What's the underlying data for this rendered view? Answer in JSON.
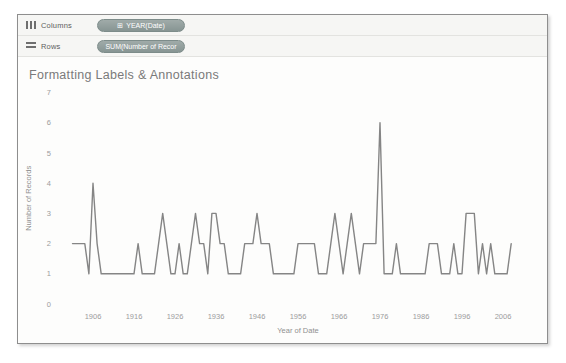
{
  "shelves": {
    "columns": {
      "label": "Columns",
      "pill": {
        "icon_glyph": "⊞",
        "text": "YEAR(Date)"
      }
    },
    "rows": {
      "label": "Rows",
      "pill": {
        "text": "SUM(Number of Recor"
      }
    }
  },
  "sheet": {
    "title": "Formatting Labels & Annotations"
  },
  "colors": {
    "line": "#858585",
    "pill_bg": "#8d9a98",
    "frame_border": "#8e8e8e",
    "axis_text": "#9c9c9c"
  },
  "chart_data": {
    "type": "line",
    "title": "Formatting Labels & Annotations",
    "xlabel": "Year of Date",
    "ylabel": "Number of Records",
    "x_ticks": [
      1906,
      1916,
      1926,
      1936,
      1946,
      1956,
      1966,
      1976,
      1986,
      1996,
      2006
    ],
    "y_ticks": [
      0,
      1,
      2,
      3,
      4,
      5,
      6,
      7
    ],
    "ylim": [
      0,
      7
    ],
    "xlim": [
      1901,
      2008
    ],
    "grid": false,
    "legend": "none",
    "line_color": "#858585",
    "series": [
      {
        "name": "SUM(Number of Records)",
        "x": [
          1901,
          1902,
          1903,
          1904,
          1905,
          1906,
          1907,
          1908,
          1909,
          1910,
          1911,
          1912,
          1913,
          1914,
          1915,
          1916,
          1917,
          1918,
          1919,
          1920,
          1921,
          1922,
          1923,
          1924,
          1925,
          1926,
          1927,
          1928,
          1929,
          1930,
          1931,
          1932,
          1933,
          1934,
          1935,
          1936,
          1937,
          1938,
          1939,
          1940,
          1941,
          1942,
          1943,
          1944,
          1945,
          1946,
          1947,
          1948,
          1949,
          1950,
          1951,
          1952,
          1953,
          1954,
          1955,
          1956,
          1957,
          1958,
          1959,
          1960,
          1961,
          1962,
          1963,
          1964,
          1965,
          1966,
          1967,
          1968,
          1969,
          1970,
          1971,
          1972,
          1973,
          1974,
          1975,
          1976,
          1977,
          1978,
          1979,
          1980,
          1981,
          1982,
          1983,
          1984,
          1985,
          1986,
          1987,
          1988,
          1989,
          1990,
          1991,
          1992,
          1993,
          1994,
          1995,
          1996,
          1997,
          1998,
          1999,
          2000,
          2001,
          2002,
          2003,
          2004,
          2005,
          2006,
          2007,
          2008
        ],
        "values": [
          2,
          2,
          2,
          2,
          1,
          4,
          2,
          1,
          1,
          1,
          1,
          1,
          1,
          1,
          1,
          1,
          2,
          1,
          1,
          1,
          1,
          2,
          3,
          2,
          1,
          1,
          2,
          1,
          1,
          2,
          3,
          2,
          2,
          1,
          3,
          3,
          2,
          2,
          1,
          1,
          1,
          1,
          2,
          2,
          2,
          3,
          2,
          2,
          2,
          1,
          1,
          1,
          1,
          1,
          1,
          2,
          2,
          2,
          2,
          2,
          1,
          1,
          1,
          2,
          3,
          2,
          1,
          2,
          3,
          2,
          1,
          2,
          2,
          2,
          2,
          6,
          1,
          1,
          1,
          2,
          1,
          1,
          1,
          1,
          1,
          1,
          1,
          2,
          2,
          2,
          1,
          1,
          1,
          2,
          1,
          1,
          3,
          3,
          3,
          1,
          2,
          1,
          2,
          1,
          1,
          1,
          1,
          2
        ]
      }
    ]
  }
}
